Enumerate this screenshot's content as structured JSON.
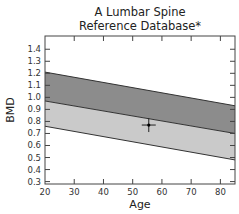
{
  "chart_data": {
    "type": "area",
    "title": "A Lumbar Spine Reference Database*",
    "title_lines": [
      "A Lumbar Spine",
      "Reference Database*"
    ],
    "xlabel": "Age",
    "ylabel": "BMD",
    "xlim": [
      20,
      85
    ],
    "ylim": [
      0.28,
      1.51
    ],
    "xticks": [
      20,
      30,
      40,
      50,
      60,
      70,
      80
    ],
    "xtick_labels": [
      "20",
      "30",
      "40",
      "50",
      "60",
      "70",
      "80"
    ],
    "yticks": [
      0.3,
      0.4,
      0.5,
      0.6,
      0.7,
      0.8,
      0.9,
      1.0,
      1.1,
      1.2,
      1.3,
      1.4
    ],
    "ytick_labels": [
      "0.3",
      "0.4",
      "0.5",
      "0.6",
      "0.7",
      "0.8",
      "0.9",
      "1.0",
      "1.1",
      "1.2",
      "1.3",
      "1.4"
    ],
    "grid": false,
    "legend": null,
    "bands": [
      {
        "name": "upper range (mean to +1 SD)",
        "color": "#8c8c8c",
        "x": [
          20,
          85
        ],
        "lower": [
          0.97,
          0.7
        ],
        "upper": [
          1.21,
          0.93
        ]
      },
      {
        "name": "lower range (-1 SD to mean)",
        "color": "#cacaca",
        "x": [
          20,
          85
        ],
        "lower": [
          0.76,
          0.48
        ],
        "upper": [
          0.97,
          0.7
        ]
      }
    ],
    "lines": [
      {
        "name": "upper boundary",
        "x": [
          20,
          85
        ],
        "y": [
          1.21,
          0.93
        ]
      },
      {
        "name": "mean",
        "x": [
          20,
          85
        ],
        "y": [
          0.97,
          0.7
        ]
      },
      {
        "name": "lower boundary",
        "x": [
          20,
          85
        ],
        "y": [
          0.76,
          0.48
        ]
      }
    ],
    "points": [
      {
        "name": "patient measurement",
        "x": 55.5,
        "y": 0.77,
        "marker": "crosshair"
      }
    ]
  },
  "colors": {
    "frame": "#444444",
    "line": "#333333",
    "text": "#222222"
  }
}
